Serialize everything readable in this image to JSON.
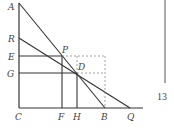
{
  "diagram": {
    "points": {
      "A": {
        "label": "A",
        "x": 19,
        "y": 3
      },
      "R": {
        "label": "R",
        "x": 19,
        "y": 38
      },
      "E": {
        "label": "E",
        "x": 19,
        "y": 56
      },
      "G": {
        "label": "G",
        "x": 19,
        "y": 73
      },
      "C": {
        "label": "C",
        "x": 19,
        "y": 108
      },
      "P": {
        "label": "P",
        "x": 62,
        "y": 56
      },
      "D": {
        "label": "D",
        "x": 77,
        "y": 73
      },
      "F": {
        "label": "F",
        "x": 62,
        "y": 108
      },
      "H": {
        "label": "H",
        "x": 77,
        "y": 108
      },
      "B": {
        "label": "B",
        "x": 105,
        "y": 108
      },
      "Q": {
        "label": "Q",
        "x": 130,
        "y": 108
      }
    },
    "labels": {
      "A": "A",
      "R": "R",
      "E": "E",
      "G": "G",
      "C": "C",
      "P": "P",
      "D": "D",
      "F": "F",
      "H": "H",
      "B": "B",
      "Q": "Q"
    }
  },
  "page": {
    "number": "13"
  },
  "colors": {
    "line": "#333333",
    "dashed": "#888888",
    "text": "#444444"
  }
}
